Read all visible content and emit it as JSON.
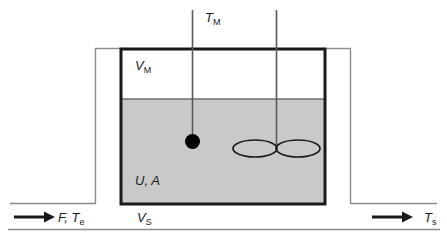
{
  "figure": {
    "colors": {
      "liquid_fill": "#c9c9c9",
      "headspace_fill": "#ffffff",
      "tank_wall": "#1a1a1a",
      "jacket_line": "#8c8c8c",
      "baseline": "#8c8c8c",
      "text": "#1a1a1a",
      "arrow": "#1a1a1a",
      "sensor_bulb": "#000000",
      "surface_line": "#6e6e6e"
    }
  },
  "labels": {
    "measured_temperature": {
      "symbol": "T",
      "subscript": "M",
      "text": "T"
    },
    "headspace_volume": {
      "symbol": "V",
      "subscript": "M",
      "text": "V"
    },
    "heat_transfer": {
      "text": "U, A"
    },
    "liquid_volume": {
      "symbol": "V",
      "subscript": "S",
      "text": "V"
    },
    "inlet_stream": {
      "text": "F, T",
      "subscript": "e"
    },
    "outlet_temperature": {
      "symbol": "T",
      "subscript": "s",
      "text": "T"
    }
  },
  "label_subscripts": {
    "measured_temperature": "M",
    "headspace_volume": "M",
    "liquid_volume": "S",
    "inlet_stream": "e",
    "outlet_temperature": "s"
  },
  "components": {
    "thermometer": {
      "name": "temperature sensor",
      "stem": "vertical line",
      "bulb": "filled circle"
    },
    "agitator": {
      "name": "impeller stirrer",
      "shaft": "vertical line",
      "blades": "two ellipses"
    },
    "tank": {
      "name": "vessel"
    },
    "jacket": {
      "name": "heating jacket outline"
    },
    "inlet_arrow": {
      "direction": "right"
    },
    "outlet_arrow": {
      "direction": "right"
    }
  }
}
